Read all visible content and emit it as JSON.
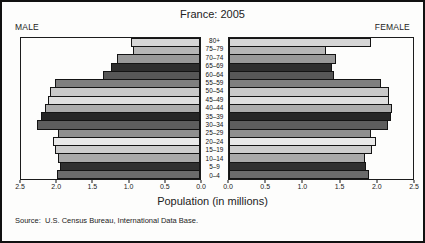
{
  "title": "France: 2005",
  "left_header": "MALE",
  "right_header": "FEMALE",
  "xlabel": "Population (in millions)",
  "source": "Source:  U.S. Census Bureau, International Data Base.",
  "chart_data": {
    "type": "bar",
    "subtype": "population-pyramid",
    "title": "France: 2005",
    "xlabel": "Population (in millions)",
    "unit": "millions of people",
    "xlim": [
      0,
      2.5
    ],
    "grid": false,
    "age_groups": [
      "80+",
      "75–79",
      "70–74",
      "65–69",
      "60–64",
      "55–59",
      "50–54",
      "45–49",
      "40–44",
      "35–39",
      "30–34",
      "25–29",
      "20–24",
      "15–19",
      "10–14",
      "5–9",
      "0–4"
    ],
    "series": [
      {
        "name": "Male",
        "side": "left",
        "values": [
          0.97,
          0.94,
          1.16,
          1.25,
          1.36,
          2.03,
          2.1,
          2.12,
          2.16,
          2.22,
          2.27,
          1.98,
          2.06,
          2.03,
          1.98,
          1.96,
          2.0
        ]
      },
      {
        "name": "Female",
        "side": "right",
        "values": [
          1.93,
          1.32,
          1.46,
          1.4,
          1.43,
          2.06,
          2.17,
          2.18,
          2.22,
          2.2,
          2.16,
          1.93,
          2.0,
          1.94,
          1.85,
          1.86,
          1.9
        ]
      }
    ],
    "tick_labels_left": [
      "2.5",
      "2.0",
      "1.5",
      "1.0",
      "0.5",
      "0.0"
    ],
    "tick_labels_right": [
      "0.0",
      "0.5",
      "1.0",
      "1.5",
      "2.0",
      "2.5"
    ],
    "bar_colors": [
      "#d6d6d6",
      "#b6b6b6",
      "#999999",
      "#2e2e2e",
      "#575757",
      "#7f7f7f",
      "#c9c9c9",
      "#dedede",
      "#ababab",
      "#262626",
      "#5e5e5e",
      "#8f8f8f",
      "#e9e9e9",
      "#cdcdcd",
      "#a9a9a9",
      "#303030",
      "#6b6b6b"
    ],
    "bar_border_color": "#141414"
  }
}
